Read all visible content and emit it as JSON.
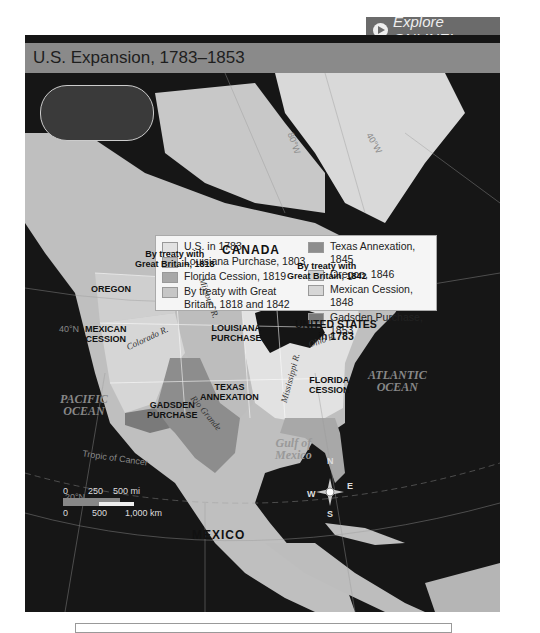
{
  "explore_button": {
    "label": "Explore ONLINE!",
    "icon": "play-circle-icon"
  },
  "map_title": "U.S. Expansion, 1783–1853",
  "legend": {
    "left": [
      {
        "label": "U.S. in 1783",
        "color": "#e2e2e2"
      },
      {
        "label": "Louisiana Purchase, 1803",
        "color": "#bdbdbd"
      },
      {
        "label": "Florida Cession, 1819",
        "color": "#a8a8a8"
      },
      {
        "label": "By treaty with Great Britain, 1818 and 1842",
        "color": "#c6c6c6"
      }
    ],
    "right": [
      {
        "label": "Texas Annexation, 1845",
        "color": "#8d8d8d"
      },
      {
        "label": "Oregon, 1846",
        "color": "#cfcfcf"
      },
      {
        "label": "Mexican Cession, 1848",
        "color": "#d6d6d6"
      },
      {
        "label": "Gadsden Purchase, 1853",
        "color": "#7a7a7a"
      }
    ]
  },
  "regions": {
    "canada": "CANADA",
    "treaty_1818": "By treaty with\nGreat Britain, 1818",
    "treaty_1842": "By treaty with\nGreat Britain, 1842",
    "oregon": "OREGON",
    "mexican_cession": "MEXICAN\nCESSION",
    "louisiana": "LOUISIANA\nPURCHASE",
    "us_1783": "UNITED STATES\nin 1783",
    "florida": "FLORIDA\nCESSION",
    "texas": "TEXAS\nANNEXATION",
    "gadsden": "GADSDEN\nPURCHASE",
    "mexico": "MEXICO"
  },
  "water": {
    "pacific": "PACIFIC\nOCEAN",
    "atlantic": "ATLANTIC\nOCEAN",
    "gulf": "Gulf of\nMexico"
  },
  "rivers": {
    "missouri": "Missouri R.",
    "colorado": "Colorado R.",
    "ohio": "Ohio R.",
    "mississippi": "Mississippi R.",
    "rio_grande": "Rio Grande"
  },
  "grid_labels": {
    "lat40": "40°N",
    "tropic": "Tropic of Cancer",
    "lat20": "20°N",
    "lon80": "80°W",
    "lon40": "40°W"
  },
  "compass": {
    "n": "N",
    "s": "S",
    "e": "E",
    "w": "W"
  },
  "scale": {
    "mi_ticks": [
      "0",
      "250",
      "500 mi"
    ],
    "km_ticks": [
      "0",
      "500",
      "1,000 km"
    ]
  }
}
